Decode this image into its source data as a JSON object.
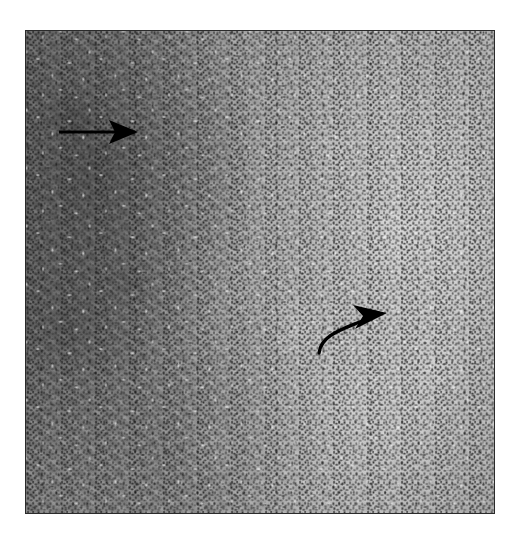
{
  "figure": {
    "type": "photomicrograph",
    "modality": "light-microscopy",
    "stain_appearance": "grayscale",
    "caption_text": "",
    "label_text": "",
    "background_color": "#ffffff",
    "panel": {
      "border_color": "#2b2b2b",
      "x": 25,
      "y": 30,
      "width": 470,
      "height": 484
    }
  },
  "tissue": {
    "description": "Densely cellular neoplasm with small hyperchromatic round cells in the left field transitioning to a paler spindled fascicular component on the right.",
    "regions": [
      {
        "name": "hypercellular-small-round-cell-zone",
        "position": "left",
        "tone": "dark",
        "tone_hex": "#6e6e6e"
      },
      {
        "name": "spindle-cell-fascicular-zone",
        "position": "right",
        "tone": "pale",
        "tone_hex": "#bdbdbd"
      },
      {
        "name": "transition-zone",
        "position": "center",
        "tone": "intermediate",
        "tone_hex": "#a2a2a2"
      }
    ]
  },
  "annotations": {
    "arrows": [
      {
        "id": "straight-arrow",
        "style": "straight",
        "color": "#000000",
        "direction": "right",
        "tail_x": 58,
        "tail_y": 131,
        "head_x": 113,
        "head_y": 131,
        "points_to": "hypercellular-small-round-cell-zone"
      },
      {
        "id": "curved-arrow",
        "style": "curved",
        "color": "#000000",
        "direction": "right",
        "tail_x": 318,
        "tail_y": 352,
        "head_x": 376,
        "head_y": 331,
        "points_to": "spindle-cell-fascicular-zone"
      }
    ]
  }
}
